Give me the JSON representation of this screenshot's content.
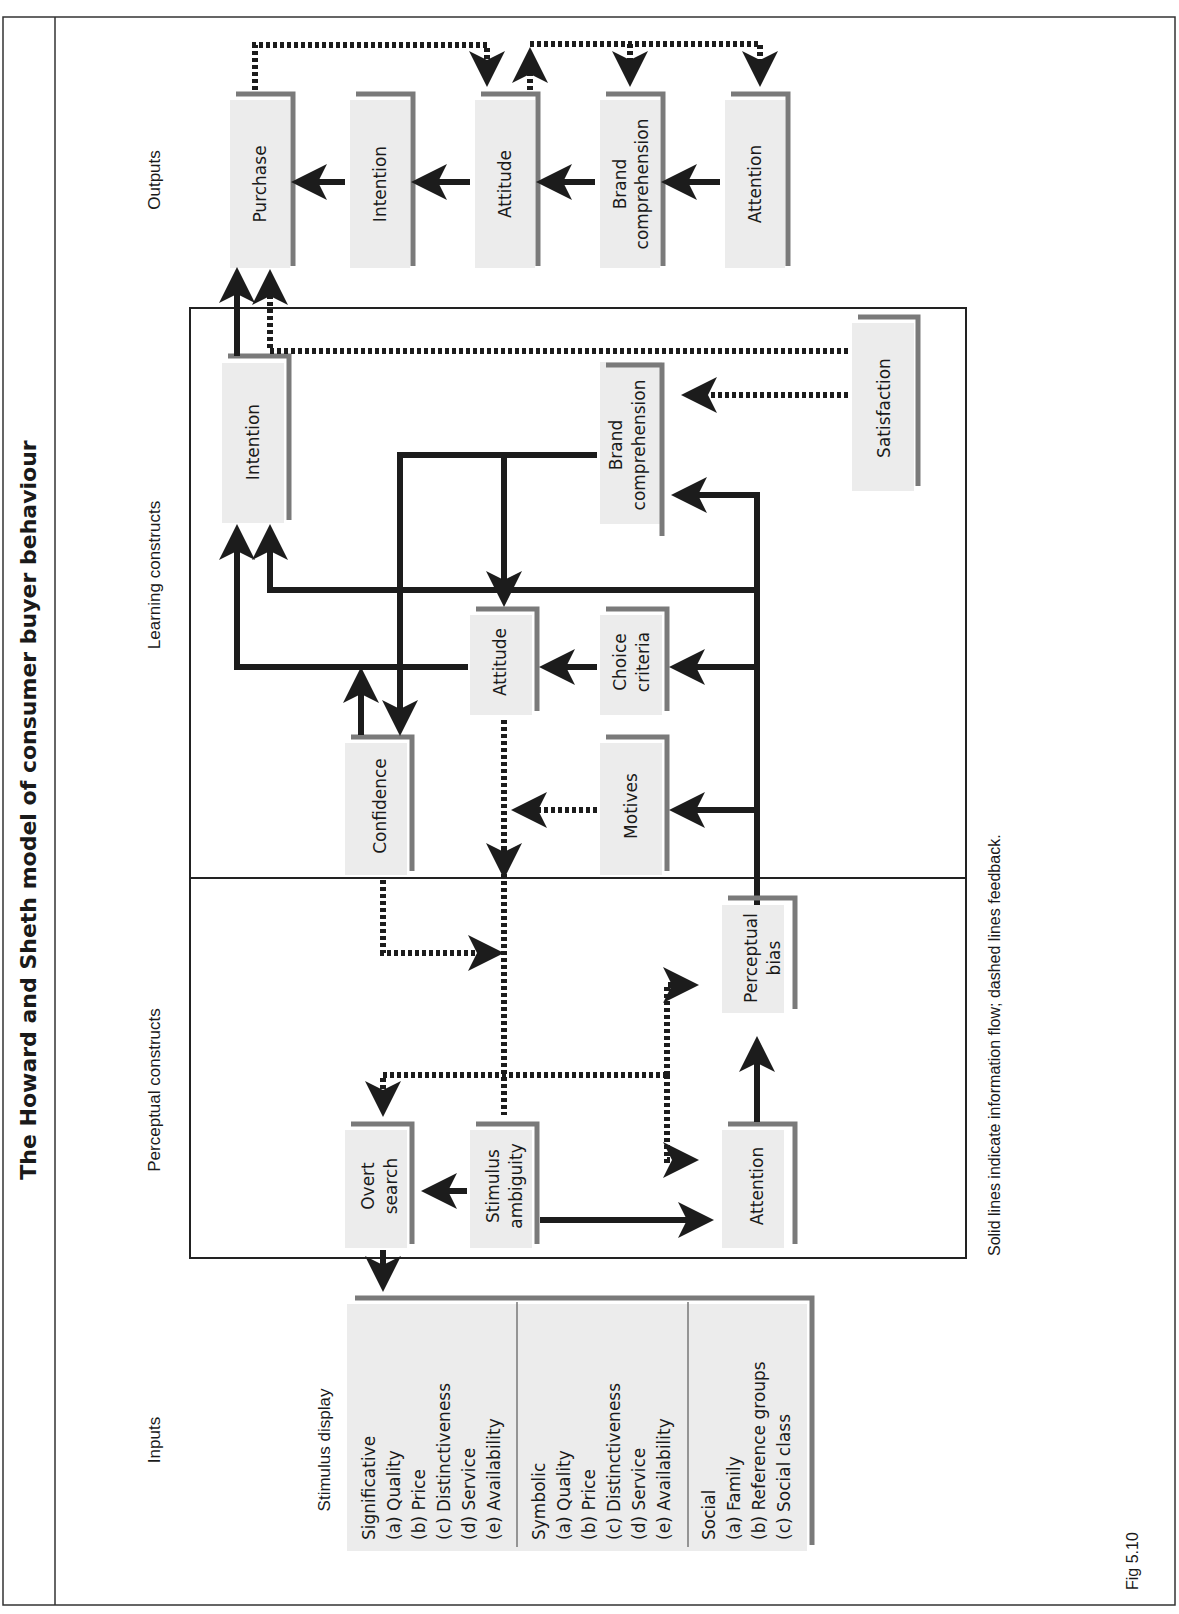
{
  "title": "The Howard and Sheth model of consumer buyer behaviour",
  "sections": {
    "inputs": "Inputs",
    "perceptual": "Perceptual constructs",
    "learning": "Learning constructs",
    "outputs": "Outputs"
  },
  "inputs": {
    "heading": "Stimulus display",
    "groups": [
      {
        "title": "Significative",
        "items": [
          "(a)  Quality",
          "(b)  Price",
          "(c)  Distinctiveness",
          "(d)  Service",
          "(e)  Availability"
        ]
      },
      {
        "title": "Symbolic",
        "items": [
          "(a)  Quality",
          "(b)  Price",
          "(c)  Distinctiveness",
          "(d)  Service",
          "(e)  Availability"
        ]
      },
      {
        "title": "Social",
        "items": [
          "(a)  Family",
          "(b)  Reference groups",
          "(c)  Social class"
        ]
      }
    ]
  },
  "perceptual_nodes": {
    "overt_search": [
      "Overt",
      "search"
    ],
    "stimulus_ambiguity": [
      "Stimulus",
      "ambiguity"
    ],
    "attention": [
      "Attention"
    ],
    "perceptual_bias": [
      "Perceptual",
      "bias"
    ]
  },
  "learning_nodes": {
    "confidence": [
      "Confidence"
    ],
    "motives": [
      "Motives"
    ],
    "attitude": [
      "Attitude"
    ],
    "choice_criteria": [
      "Choice",
      "criteria"
    ],
    "intention": [
      "Intention"
    ],
    "brand_comprehension": [
      "Brand",
      "comprehension"
    ],
    "satisfaction": [
      "Satisfaction"
    ]
  },
  "output_nodes": {
    "purchase": [
      "Purchase"
    ],
    "intention": [
      "Intention"
    ],
    "attitude": [
      "Attitude"
    ],
    "brand_comprehension": [
      "Brand",
      "comprehension"
    ],
    "attention": [
      "Attention"
    ]
  },
  "legend_note": "Solid lines indicate information flow; dashed lines feedback.",
  "figure_label": "Fig 5.10"
}
